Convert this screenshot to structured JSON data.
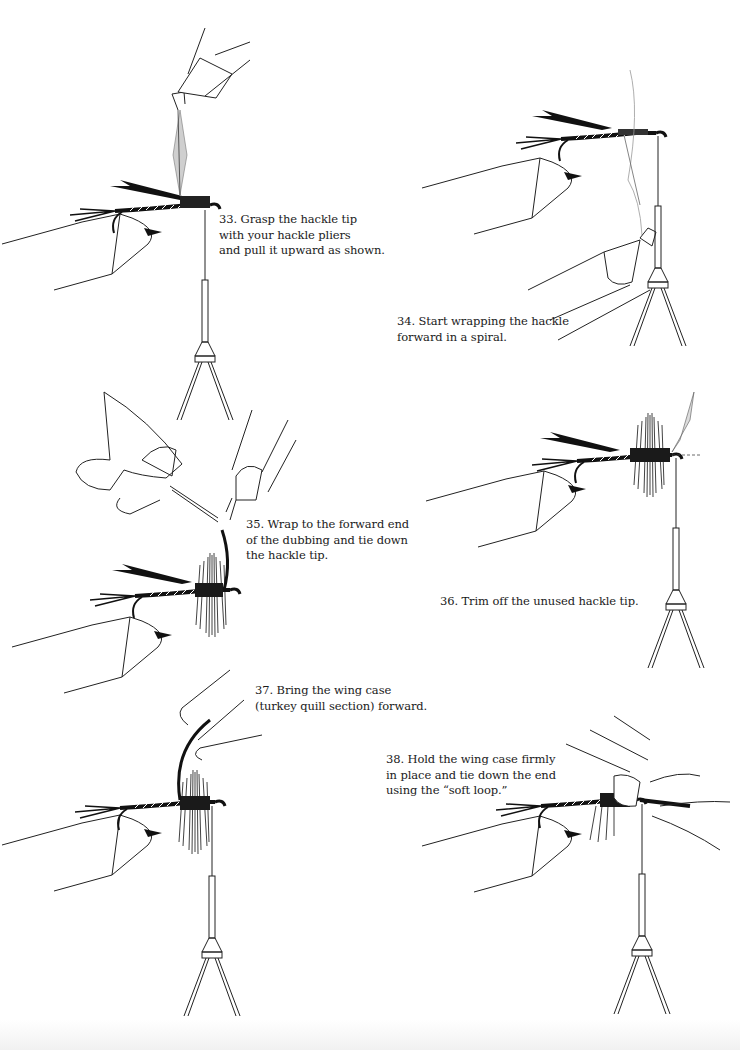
{
  "page": {
    "type": "fly tying instructions",
    "background": "#ffffff",
    "ink": "#1a1a1a"
  },
  "steps": [
    {
      "number": "33",
      "lines": [
        "33.  Grasp the hackle tip",
        "with your hackle pliers",
        "and pull it upward as shown."
      ],
      "illustration": "hackle-pliers-pulling-hackle-upward"
    },
    {
      "number": "34",
      "lines": [
        "34.  Start wrapping the hackle",
        "forward in a spiral."
      ],
      "illustration": "wrapping-hackle-spiral"
    },
    {
      "number": "35",
      "lines": [
        "35.  Wrap to the forward end",
        "of the dubbing and tie down",
        "the hackle tip."
      ],
      "illustration": "tying-down-hackle-tip"
    },
    {
      "number": "36",
      "lines": [
        "36.  Trim off the unused hackle tip."
      ],
      "illustration": "trimmed-hackle"
    },
    {
      "number": "37",
      "lines": [
        "37.  Bring the wing case",
        "(turkey quill section) forward."
      ],
      "illustration": "bringing-wing-case-forward"
    },
    {
      "number": "38",
      "lines": [
        "38.  Hold the wing case firmly",
        "in place and tie down the end",
        "using the “soft loop.”"
      ],
      "illustration": "soft-loop-tie-down"
    }
  ]
}
